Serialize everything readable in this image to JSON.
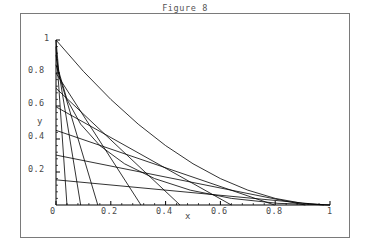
{
  "figure": {
    "title": "Figure 8",
    "frame": {
      "border_color": "#7a7a7a",
      "background": "#ffffff"
    }
  },
  "axes": {
    "x_label": "x",
    "y_label": "y",
    "x_ticks": [
      "0",
      "0.2",
      "0.4",
      "0.6",
      "0.8",
      "1"
    ],
    "y_ticks": [
      "0.2",
      "0.4",
      "0.6",
      "0.8",
      "1"
    ],
    "x_tick_values": [
      0,
      0.2,
      0.4,
      0.6,
      0.8,
      1
    ],
    "y_tick_values": [
      0.2,
      0.4,
      0.6,
      0.8,
      1
    ],
    "line_color": "#000000"
  },
  "chart_data": {
    "type": "line",
    "title": "Figure 8",
    "xlabel": "x",
    "ylabel": "y",
    "xlim": [
      0,
      1
    ],
    "ylim": [
      0,
      1
    ],
    "grid": false,
    "legend": "none",
    "series": [
      {
        "name": "chord-t-0.15",
        "kind": "segment",
        "x": [
          0,
          0.9775
        ],
        "y": [
          0.1525,
          0
        ]
      },
      {
        "name": "chord-t-0.30",
        "kind": "segment",
        "x": [
          0,
          0.91
        ],
        "y": [
          0.3025,
          0
        ]
      },
      {
        "name": "chord-t-0.45",
        "kind": "segment",
        "x": [
          0,
          0.7975
        ],
        "y": [
          0.4525,
          0
        ]
      },
      {
        "name": "chord-t-0.60",
        "kind": "segment",
        "x": [
          0,
          0.64
        ],
        "y": [
          0.595,
          0
        ]
      },
      {
        "name": "chord-t-0.70",
        "kind": "segment",
        "x": [
          0,
          0.4525
        ],
        "y": [
          0.7075,
          0
        ]
      },
      {
        "name": "chord-t-0.80",
        "kind": "segment",
        "x": [
          0,
          0.31
        ],
        "y": [
          0.8,
          0
        ]
      },
      {
        "name": "chord-t-0.85",
        "kind": "segment",
        "x": [
          0,
          0.1525
        ],
        "y": [
          0.85,
          0
        ]
      },
      {
        "name": "chord-t-0.90",
        "kind": "segment",
        "x": [
          0,
          0.09
        ],
        "y": [
          0.91,
          0
        ]
      },
      {
        "name": "chord-t-0.95",
        "kind": "segment",
        "x": [
          0,
          0.04
        ],
        "y": [
          0.96,
          0
        ]
      },
      {
        "name": "envelope",
        "kind": "curve",
        "equation": "sqrt(x) + sqrt(y) = 1",
        "x": [
          0,
          0.01,
          0.04,
          0.09,
          0.16,
          0.25,
          0.36,
          0.49,
          0.64,
          0.81,
          1.0
        ],
        "y": [
          1.0,
          0.81,
          0.64,
          0.49,
          0.36,
          0.25,
          0.16,
          0.09,
          0.04,
          0.01,
          0
        ]
      },
      {
        "name": "envelope-secondary",
        "kind": "curve",
        "equation": "y = (1-x)^2",
        "x": [
          0,
          0.1,
          0.2,
          0.3,
          0.4,
          0.5,
          0.6,
          0.7,
          0.8,
          0.9,
          1.0
        ],
        "y": [
          1.0,
          0.81,
          0.64,
          0.49,
          0.36,
          0.25,
          0.16,
          0.09,
          0.04,
          0.01,
          0
        ]
      }
    ]
  },
  "tick_positions": {
    "x": [
      {
        "label": "0",
        "left": 50,
        "top": 206
      },
      {
        "label": "0.2",
        "left": 101,
        "top": 206
      },
      {
        "label": "0.4",
        "left": 156,
        "top": 206
      },
      {
        "label": "0.6",
        "left": 211,
        "top": 206
      },
      {
        "label": "0.8",
        "left": 266,
        "top": 206
      },
      {
        "label": "1",
        "left": 327,
        "top": 206
      }
    ],
    "y": [
      {
        "label": "0.2",
        "left": 28,
        "top": 164
      },
      {
        "label": "0.4",
        "left": 28,
        "top": 131
      },
      {
        "label": "0.6",
        "left": 28,
        "top": 98
      },
      {
        "label": "0.8",
        "left": 28,
        "top": 65
      },
      {
        "label": "1",
        "left": 44,
        "top": 33
      }
    ],
    "axis_names": {
      "x": {
        "left": 185,
        "top": 211
      },
      "y": {
        "left": 37,
        "top": 116
      }
    }
  }
}
